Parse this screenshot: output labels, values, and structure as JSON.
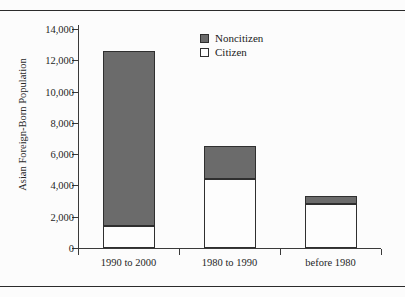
{
  "page": {
    "clipped_caption": "",
    "rule_color": "#2b2b2b",
    "background": "#fcfcfc"
  },
  "legend": {
    "position": "top-center",
    "items": [
      {
        "label": "Noncitizen",
        "color": "#6b6b6b",
        "swatch": "filled-square-icon"
      },
      {
        "label": "Citizen",
        "color": "#fdfdfd",
        "swatch": "empty-square-icon"
      }
    ]
  },
  "axes": {
    "ylabel": "Asian Foreign-Born Population",
    "xlabel": "",
    "yticks": [
      "0",
      "2,000",
      "4,000",
      "6,000",
      "8,000",
      "10,000",
      "12,000",
      "14,000"
    ],
    "ytick_values": [
      0,
      2000,
      4000,
      6000,
      8000,
      10000,
      12000,
      14000
    ],
    "ymin": 0,
    "ymax": 14000
  },
  "chart_data": {
    "type": "bar",
    "subtype": "stacked-vertical",
    "title": "",
    "xlabel": "",
    "ylabel": "Asian Foreign-Born Population",
    "categories": [
      "1990 to 2000",
      "1980 to 1990",
      "before 1980"
    ],
    "series": [
      {
        "name": "Citizen",
        "color": "#fdfdfd",
        "values": [
          1400,
          4400,
          2800
        ]
      },
      {
        "name": "Noncitizen",
        "color": "#6b6b6b",
        "values": [
          11200,
          2150,
          500
        ]
      }
    ],
    "totals": [
      12600,
      6550,
      3300
    ],
    "ylim": [
      0,
      14000
    ],
    "ytick_step": 2000,
    "grid": false,
    "legend_position": "top-center",
    "stack_order": [
      "Citizen",
      "Noncitizen"
    ]
  }
}
